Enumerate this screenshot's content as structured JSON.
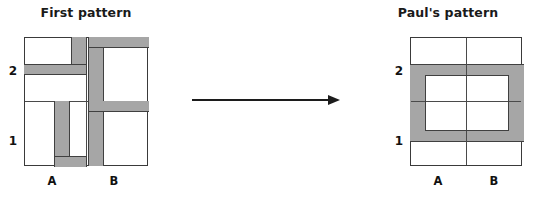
{
  "canvas": {
    "width": 534,
    "height": 197,
    "background": "#ffffff"
  },
  "colors": {
    "shape_fill": "#a6a6a6",
    "shape_stroke": "#404040",
    "grid_stroke": "#4a4a4a",
    "box_stroke": "#3a3a3a",
    "text": "#111111",
    "arrow": "#1c1c1c"
  },
  "left_panel": {
    "title": "First pattern",
    "row_labels": [
      "2",
      "1"
    ],
    "column_labels": [
      "A",
      "B"
    ],
    "box": {
      "x": 24,
      "y": 37,
      "width": 124,
      "height": 129
    },
    "cells": [
      {
        "name": "cell-A2",
        "quadrant": "top-left",
        "shape": "reversed-L",
        "parts": [
          {
            "x": 47,
            "y": 0,
            "width": 15,
            "height": 26
          },
          {
            "x": 0,
            "y": 26,
            "width": 62,
            "height": 10
          }
        ]
      },
      {
        "name": "cell-B2",
        "quadrant": "top-right",
        "shape": "rotated-L",
        "parts": [
          {
            "x": 2,
            "y": 0,
            "width": 15,
            "height": 64
          },
          {
            "x": 2,
            "y": 0,
            "width": 60,
            "height": 10
          }
        ]
      },
      {
        "name": "cell-A1",
        "quadrant": "bottom-left",
        "shape": "rotated-L",
        "parts": [
          {
            "x": 30,
            "y": 0,
            "width": 15,
            "height": 64
          },
          {
            "x": 30,
            "y": 54,
            "width": 32,
            "height": 10
          }
        ]
      },
      {
        "name": "cell-B1",
        "quadrant": "bottom-right",
        "shape": "rotated-L",
        "parts": [
          {
            "x": 2,
            "y": 0,
            "width": 15,
            "height": 64
          },
          {
            "x": 2,
            "y": 0,
            "width": 60,
            "height": 10
          }
        ]
      }
    ]
  },
  "right_panel": {
    "title": "Paul's pattern",
    "row_labels": [
      "2",
      "1"
    ],
    "column_labels": [
      "A",
      "B"
    ],
    "box": {
      "x": 410,
      "y": 37,
      "width": 112,
      "height": 129
    },
    "shape": {
      "name": "rectangular-ring",
      "outer": {
        "x": 0,
        "y": 26,
        "width": 112,
        "height": 77
      },
      "inner": {
        "x": 14,
        "y": 37,
        "width": 84,
        "height": 55
      }
    }
  },
  "arrow": {
    "name": "transformation-arrow",
    "x": 192,
    "y": 100,
    "length": 148,
    "thickness": 2,
    "direction": "right"
  }
}
